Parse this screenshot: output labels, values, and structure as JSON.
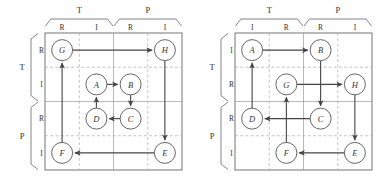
{
  "figure": {
    "type": "dsm-grid-diagram",
    "panel_count": 2,
    "colors": {
      "grid_line": "#999999",
      "dashed_line": "#aaaaaa",
      "border": "#666666",
      "node_stroke": "#555555",
      "edge": "#444444",
      "text": "#333333",
      "background": "#ffffff"
    }
  },
  "panels": [
    {
      "id": "left-panel",
      "name": "panel-before",
      "columns": {
        "groups": [
          {
            "label": "T",
            "subs": [
              "R",
              "I"
            ]
          },
          {
            "label": "P",
            "subs": [
              "R",
              "I"
            ]
          }
        ],
        "order": [
          "T.R",
          "T.I",
          "P.R",
          "P.I"
        ]
      },
      "rows": {
        "groups": [
          {
            "label": "T",
            "subs": [
              "R",
              "I"
            ]
          },
          {
            "label": "P",
            "subs": [
              "R",
              "I"
            ]
          }
        ],
        "order": [
          "T.R",
          "T.I",
          "P.R",
          "P.I"
        ]
      },
      "nodes": [
        {
          "label": "G",
          "col": 0,
          "row": 0
        },
        {
          "label": "H",
          "col": 3,
          "row": 0
        },
        {
          "label": "A",
          "col": 1,
          "row": 1
        },
        {
          "label": "B",
          "col": 2,
          "row": 1
        },
        {
          "label": "D",
          "col": 1,
          "row": 2
        },
        {
          "label": "C",
          "col": 2,
          "row": 2
        },
        {
          "label": "F",
          "col": 0,
          "row": 3
        },
        {
          "label": "E",
          "col": 3,
          "row": 3
        }
      ],
      "edges": [
        {
          "from": "G",
          "to": "H"
        },
        {
          "from": "H",
          "to": "E"
        },
        {
          "from": "E",
          "to": "F"
        },
        {
          "from": "F",
          "to": "G"
        },
        {
          "from": "A",
          "to": "B"
        },
        {
          "from": "B",
          "to": "C"
        },
        {
          "from": "C",
          "to": "D"
        },
        {
          "from": "D",
          "to": "A"
        }
      ]
    },
    {
      "id": "right-panel",
      "name": "panel-after",
      "columns": {
        "groups": [
          {
            "label": "T",
            "subs": [
              "I",
              "R"
            ]
          },
          {
            "label": "P",
            "subs": [
              "R",
              "I"
            ]
          }
        ],
        "order": [
          "T.I",
          "T.R",
          "P.R",
          "P.I"
        ]
      },
      "rows": {
        "groups": [
          {
            "label": "T",
            "subs": [
              "I",
              "R"
            ]
          },
          {
            "label": "P",
            "subs": [
              "R",
              "I"
            ]
          }
        ],
        "order": [
          "T.I",
          "T.R",
          "P.R",
          "P.I"
        ]
      },
      "nodes": [
        {
          "label": "A",
          "col": 0,
          "row": 0
        },
        {
          "label": "B",
          "col": 2,
          "row": 0
        },
        {
          "label": "G",
          "col": 1,
          "row": 1
        },
        {
          "label": "H",
          "col": 3,
          "row": 1
        },
        {
          "label": "D",
          "col": 0,
          "row": 2
        },
        {
          "label": "C",
          "col": 2,
          "row": 2
        },
        {
          "label": "F",
          "col": 1,
          "row": 3
        },
        {
          "label": "E",
          "col": 3,
          "row": 3
        }
      ],
      "edges": [
        {
          "from": "A",
          "to": "B"
        },
        {
          "from": "B",
          "to": "C"
        },
        {
          "from": "C",
          "to": "D"
        },
        {
          "from": "D",
          "to": "A"
        },
        {
          "from": "G",
          "to": "H"
        },
        {
          "from": "H",
          "to": "E"
        },
        {
          "from": "E",
          "to": "F"
        },
        {
          "from": "F",
          "to": "G"
        }
      ]
    }
  ]
}
